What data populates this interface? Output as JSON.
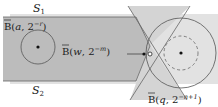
{
  "diagram": {
    "region_top_label": "S",
    "region_top_sub": "1",
    "region_bottom_label": "S",
    "region_bottom_sub": "2",
    "ball_a": {
      "bar": "B",
      "open": "(",
      "center": "a",
      "sep": ", 2",
      "exp": "−r",
      "close": ")"
    },
    "ball_w": {
      "bar": "B",
      "open": "(",
      "center": "w",
      "sep": ", 2",
      "exp": "−m",
      "close": ")"
    },
    "ball_q": {
      "bar": "B",
      "open": "(",
      "center": "q",
      "sep": ", 2",
      "exp": "−n+1",
      "close": ")"
    },
    "colors": {
      "light_region": "#d6d6d6",
      "dark_region": "#b9b9b9",
      "background": "#ffffff",
      "stroke": "#555555"
    }
  }
}
